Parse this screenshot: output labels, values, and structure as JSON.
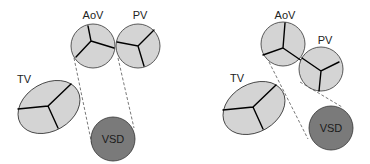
{
  "colors": {
    "valve_fill": "#d4d4d4",
    "vsd_fill": "#7a7a7a",
    "outline": "#333333",
    "commissure": "#000000",
    "dash": "#555555"
  },
  "panels": [
    {
      "id": "left",
      "labels": {
        "aov": "AoV",
        "pv": "PV",
        "tv": "TV",
        "vsd": "VSD"
      }
    },
    {
      "id": "right",
      "labels": {
        "aov": "AoV",
        "pv": "PV",
        "tv": "TV",
        "vsd": "VSD"
      }
    }
  ]
}
